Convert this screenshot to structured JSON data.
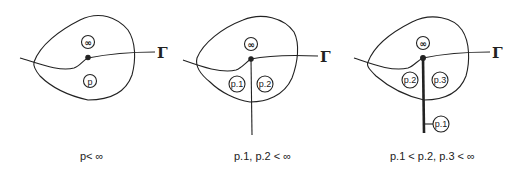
{
  "diagrams": [
    {
      "id": "panel-1",
      "curve_label": "Γ",
      "nodes": [
        {
          "label": "∞"
        },
        {
          "label": "p"
        }
      ],
      "caption": "p< ∞"
    },
    {
      "id": "panel-2",
      "curve_label": "Γ",
      "nodes": [
        {
          "label": "∞"
        },
        {
          "label": "p.1"
        },
        {
          "label": "p.2"
        }
      ],
      "caption": "p.1, p.2 < ∞"
    },
    {
      "id": "panel-3",
      "curve_label": "Γ",
      "nodes": [
        {
          "label": "∞"
        },
        {
          "label": "p.2"
        },
        {
          "label": "p.3"
        },
        {
          "label": "p.1"
        }
      ],
      "caption": "p.1 < p.2, p.3 < ∞"
    }
  ]
}
